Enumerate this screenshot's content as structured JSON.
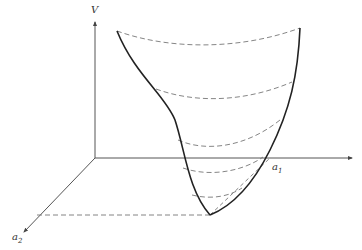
{
  "figure": {
    "type": "3d-surface-sketch",
    "colors": {
      "background": "#ffffff",
      "axis": "#555555",
      "surface_edge": "#222222",
      "dashed": "#777777"
    }
  },
  "axes": {
    "v": {
      "label": "V",
      "origin": [
        95,
        158
      ],
      "end": [
        95,
        22
      ]
    },
    "a1": {
      "label": "a",
      "subscript": "1",
      "origin": [
        95,
        158
      ],
      "end": [
        352,
        158
      ]
    },
    "a2": {
      "label": "a",
      "subscript": "2",
      "origin": [
        95,
        158
      ],
      "end": [
        24,
        232
      ]
    }
  },
  "surface": {
    "left_edge": "M117,31 C135,75 165,95 175,120 C185,150 188,190 210,215",
    "right_edge": "M300,28 C298,75 290,110 270,150 C255,180 235,205 210,215",
    "contours": [
      "M117,31 C170,50 240,50 300,28",
      "M156,89 C200,105 250,100 292,82",
      "M178,140 C205,152 245,148 280,120",
      "M183,168 C212,178 245,170 263,157",
      "M192,195 C212,200 230,196 242,188"
    ],
    "minimum": [
      210,
      215
    ]
  },
  "projections": {
    "to_a2": "M37,215 L210,215",
    "to_a1": "M210,215 L270,158"
  }
}
